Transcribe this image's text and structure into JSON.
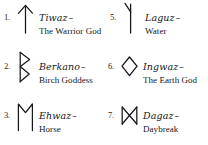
{
  "page": {
    "ink_color": "#17161a",
    "background_color": "#ffffff"
  },
  "columns": {
    "left_label": "left-column",
    "right_label": "right-column"
  },
  "entries": [
    {
      "number": "1.",
      "icon": "tiwaz-rune-icon",
      "name": "Tiwaz",
      "dash": "–",
      "meaning": "The Warrior God",
      "column": "left",
      "row": 1
    },
    {
      "number": "2.",
      "icon": "berkano-rune-icon",
      "name": "Berkano",
      "dash": "–",
      "meaning": "Birch Goddess",
      "column": "left",
      "row": 2
    },
    {
      "number": "3.",
      "icon": "ehwaz-rune-icon",
      "name": "Ehwaz",
      "dash": "–",
      "meaning": "Horse",
      "column": "left",
      "row": 3
    },
    {
      "number": "5.",
      "icon": "laguz-rune-icon",
      "name": "Laguz",
      "dash": "–",
      "meaning": "Water",
      "column": "right",
      "row": 1
    },
    {
      "number": "6.",
      "icon": "ingwaz-rune-icon",
      "name": "Ingwaz",
      "dash": "–",
      "meaning": "The Earth God",
      "column": "right",
      "row": 2
    },
    {
      "number": "7.",
      "icon": "dagaz-rune-icon",
      "name": "Dagaz",
      "dash": "–",
      "meaning": "Daybreak",
      "column": "right",
      "row": 3
    }
  ]
}
